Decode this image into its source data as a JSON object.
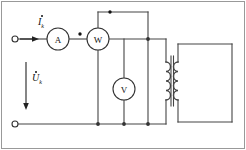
{
  "diagram": {
    "border_color": "#999999",
    "wire_color": "#444444",
    "ink_color": "#111111",
    "background": "#ffffff"
  },
  "labels": {
    "current": {
      "symbol": "I",
      "subscript": "k",
      "accent": "dot",
      "name": "short-circuit-current"
    },
    "voltage": {
      "symbol": "U",
      "subscript": "k",
      "accent": "dot",
      "name": "short-circuit-voltage"
    }
  },
  "meters": [
    {
      "id": "ammeter",
      "letter": "A",
      "name": "ammeter",
      "cx": 58,
      "cy": 39,
      "r": 11
    },
    {
      "id": "wattmeter",
      "letter": "W",
      "name": "wattmeter",
      "cx": 98,
      "cy": 39,
      "r": 11
    },
    {
      "id": "voltmeter",
      "letter": "V",
      "name": "voltmeter",
      "cx": 124,
      "cy": 89,
      "r": 11
    }
  ],
  "terminals": [
    {
      "id": "top-left-terminal",
      "name": "input-terminal-top",
      "cx": 15,
      "cy": 39,
      "r": 3
    },
    {
      "id": "bottom-left-terminal",
      "name": "input-terminal-bottom",
      "cx": 15,
      "cy": 124,
      "r": 3
    }
  ],
  "polarity_marks": [
    {
      "id": "wattmeter-current-coil-dot",
      "name": "polarity-dot-current-coil",
      "cx": 80,
      "cy": 34,
      "r": 1.6
    },
    {
      "id": "wattmeter-voltage-coil-dot",
      "name": "polarity-dot-voltage-coil",
      "cx": 110,
      "cy": 12,
      "r": 1.6
    }
  ],
  "junctions": [
    {
      "name": "node-top-right",
      "cx": 148,
      "cy": 39,
      "r": 1.8
    },
    {
      "name": "node-bottom-mid",
      "cx": 124,
      "cy": 124,
      "r": 1.8
    },
    {
      "name": "node-bottom-right",
      "cx": 148,
      "cy": 124,
      "r": 1.8
    }
  ],
  "transformer": {
    "name": "transformer",
    "primary_coil": {
      "name": "primary-winding",
      "x": 166,
      "y_top": 62,
      "y_bottom": 100,
      "turns": 4
    },
    "secondary_coil": {
      "name": "secondary-winding",
      "x": 178,
      "y_top": 62,
      "y_bottom": 100,
      "turns": 4
    },
    "core": {
      "name": "transformer-core",
      "x1": 171,
      "x2": 173,
      "y_top": 56,
      "y_bottom": 106
    },
    "secondary_loop": {
      "name": "secondary-open-loop",
      "left": 178,
      "right": 232,
      "top": 44,
      "bottom": 122
    }
  },
  "arrows": {
    "current_arrow": {
      "name": "current-direction-arrow",
      "x1": 20,
      "y1": 39,
      "x2": 38,
      "y2": 39,
      "direction": "right"
    },
    "voltage_arrow": {
      "name": "voltage-direction-arrow",
      "x1": 26,
      "y1": 62,
      "x2": 26,
      "y2": 110,
      "direction": "down"
    }
  }
}
